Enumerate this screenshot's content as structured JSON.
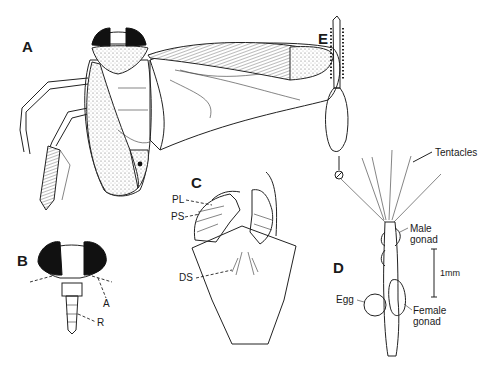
{
  "figure": {
    "panels": {
      "A": {
        "label": "A",
        "subject": "insect dorsal view"
      },
      "B": {
        "label": "B",
        "subject": "head frontal view",
        "annotations": {
          "antenna": "A",
          "rostrum": "R"
        }
      },
      "C": {
        "label": "C",
        "subject": "terminal segment",
        "annotations": {
          "pl": "PL",
          "ps": "PS",
          "ds": "DS"
        }
      },
      "D": {
        "label": "D",
        "subject": "polyp",
        "annotations": {
          "tentacles": "Tentacles",
          "male_gonad_1": "Male",
          "male_gonad_2": "gonad",
          "female_gonad_1": "Female",
          "female_gonad_2": "gonad",
          "egg": "Egg",
          "scale": "1mm"
        }
      },
      "E": {
        "label": "E",
        "subject": "tentacle detail"
      }
    }
  }
}
